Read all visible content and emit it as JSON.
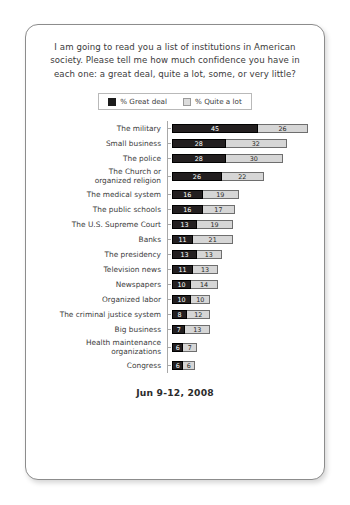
{
  "card": {
    "title": "I am going to read you a list of institutions in American society. Please tell me how much confidence you have in each one: a great deal, quite a lot, some, or very little?",
    "footer": "Jun 9-12, 2008"
  },
  "legend": {
    "great_deal": "% Great deal",
    "quite_a_lot": "% Quite a lot"
  },
  "colors": {
    "great_deal": "#231f20",
    "quite_a_lot": "#d6d6d6",
    "card_border": "#8c8c8c",
    "axis": "#a8a8a8",
    "text": "#3b3b3b"
  },
  "chart_data": {
    "type": "bar",
    "subtype": "stacked-horizontal",
    "title": "I am going to read you a list of institutions in American society. Please tell me how much confidence you have in each one: a great deal, quite a lot, some, or very little?",
    "xlabel": "",
    "ylabel": "",
    "xlim": [
      0,
      71
    ],
    "grid": false,
    "legend_position": "top-center",
    "categories": [
      "The military",
      "Small business",
      "The police",
      "The Church or\norganized religion",
      "The medical system",
      "The public schools",
      "The U.S. Supreme Court",
      "Banks",
      "The presidency",
      "Television news",
      "Newspapers",
      "Organized labor",
      "The criminal justice system",
      "Big business",
      "Health maintenance\norganizations",
      "Congress"
    ],
    "series": [
      {
        "name": "% Great deal",
        "values": [
          45,
          28,
          28,
          26,
          16,
          16,
          13,
          11,
          13,
          11,
          10,
          10,
          8,
          7,
          6,
          6
        ]
      },
      {
        "name": "% Quite a lot",
        "values": [
          26,
          32,
          30,
          22,
          19,
          17,
          19,
          21,
          13,
          13,
          14,
          10,
          12,
          13,
          7,
          6
        ]
      }
    ],
    "totals": [
      71,
      60,
      58,
      48,
      35,
      33,
      32,
      32,
      26,
      24,
      24,
      20,
      20,
      20,
      13,
      12
    ],
    "annotation": "Jun 9-12, 2008"
  }
}
